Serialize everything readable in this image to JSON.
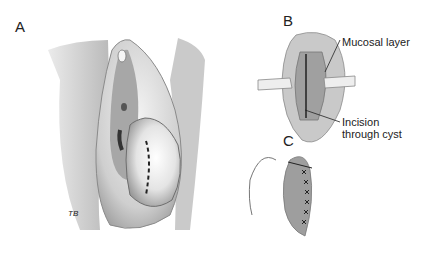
{
  "figure": {
    "panels": [
      {
        "id": "A",
        "label": "A",
        "signature": "TB"
      },
      {
        "id": "B",
        "label": "B",
        "callouts": [
          "Mucosal layer",
          "Incision",
          "through cyst"
        ]
      },
      {
        "id": "C",
        "label": "C"
      }
    ]
  }
}
